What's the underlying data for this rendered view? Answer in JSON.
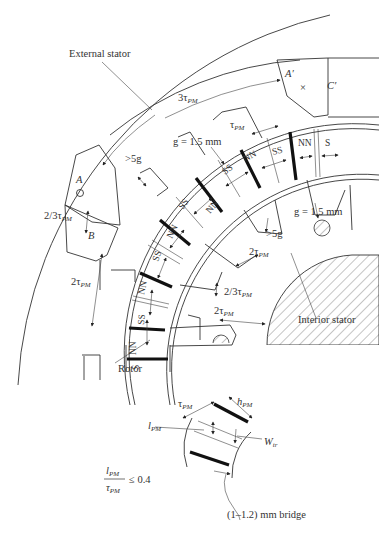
{
  "diagram": {
    "labels": {
      "external_stator": "External stator",
      "interior_stator": "Interior stator",
      "rotor": "Rotor",
      "phase_a": "A",
      "phase_a_prime": "A′",
      "phase_b": "B",
      "phase_c_prime": "C′"
    },
    "dimensions": {
      "three_tau": "3τ",
      "tau": "τ",
      "sub_pm": "PM",
      "gap_outer": "g = 1.5 mm",
      "gap_inner": "g = 1.5 mm",
      "gt5g_1": ">5g",
      "gt5g_2": ">5g",
      "two_thirds_tau_1": "2/3τ",
      "two_thirds_tau_2": "2/3τ",
      "two_tau_1": "2τ",
      "two_tau_2": "2τ",
      "two_tau_3": "2τ"
    },
    "poles": [
      "SS",
      "NN",
      "SS",
      "NN",
      "SS",
      "NN",
      "SS",
      "NN",
      "S"
    ],
    "pole_extra": "S",
    "detail": {
      "tau_pm": "τ",
      "h_pm": "h",
      "l_pm": "l",
      "w_tr": "W",
      "w_sub": "tr",
      "bridge": "(1–1.2) mm bridge",
      "ratio_num": "l",
      "ratio_den": "τ",
      "ratio_rhs": "≤ 0.4"
    },
    "symbols": {
      "cross": "×",
      "dot": "○"
    }
  }
}
